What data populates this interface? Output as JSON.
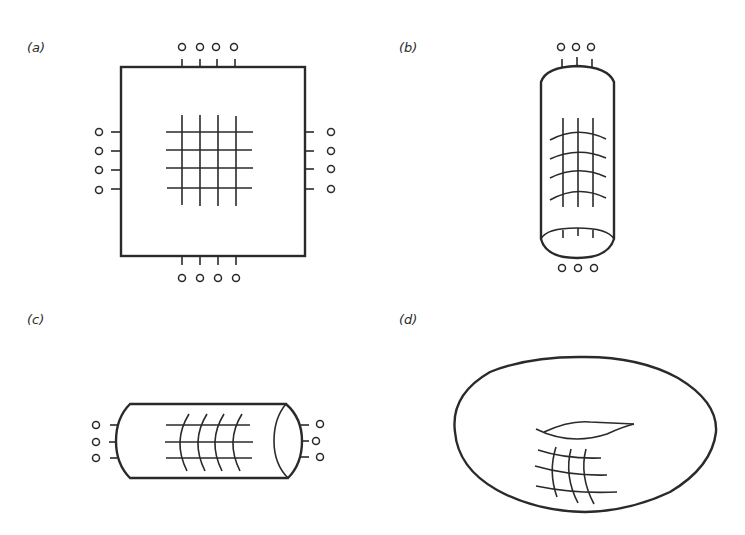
{
  "figure": {
    "panels": [
      {
        "id": "a",
        "label": "(a)",
        "shape": "square",
        "description": "flat square lattice with open boundary terminals on all four sides",
        "terminals": {
          "top": 4,
          "bottom": 4,
          "left": 4,
          "right": 4
        },
        "grid": {
          "rows": 4,
          "cols": 4
        }
      },
      {
        "id": "b",
        "label": "(b)",
        "shape": "vertical cylinder",
        "description": "lattice wrapped into a vertical cylinder with terminals at top and bottom",
        "terminals": {
          "top": 3,
          "bottom": 3
        },
        "grid": {
          "rows": 4,
          "cols": 3
        }
      },
      {
        "id": "c",
        "label": "(c)",
        "shape": "horizontal cylinder",
        "description": "lattice wrapped into a horizontal cylinder with terminals at left and right",
        "terminals": {
          "left": 3,
          "right": 3
        },
        "grid": {
          "rows": 3,
          "cols": 4
        }
      },
      {
        "id": "d",
        "label": "(d)",
        "shape": "torus",
        "description": "lattice wrapped into a torus with no terminals",
        "terminals": {},
        "grid": {
          "rows": 3,
          "cols": 3
        }
      }
    ],
    "colors": {
      "line": "#2a2a2a",
      "background": "#ffffff"
    }
  }
}
